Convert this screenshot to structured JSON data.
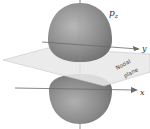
{
  "diagram": {
    "orbital_label": "p",
    "orbital_subscript": "z",
    "axis_y_label": "y",
    "axis_x_label": "x",
    "plane_label_line1": "Nodal",
    "plane_label_line2": "plane",
    "colors": {
      "lobe": "#8a8a8a",
      "lobe_highlight": "#b5b5b5",
      "plane": "#e6e6e6",
      "axis": "#6a6a6a"
    }
  }
}
